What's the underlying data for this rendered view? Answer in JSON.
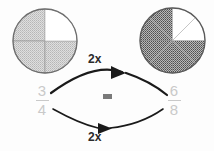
{
  "diagram": {
    "background_color": "#fdfdfd",
    "left_pie": {
      "name": "three-fourths-pie",
      "total_sectors": 4,
      "shaded_sectors": 3,
      "unshaded_sectors": 1,
      "unshaded_position": "upper-right quadrant",
      "fill_color": "#d0d0d0",
      "outline_color": "#6e6e6e",
      "divider_color": "#9a9a9a",
      "pattern": "fine dotted stipple"
    },
    "right_pie": {
      "name": "six-eighths-pie",
      "total_sectors": 8,
      "shaded_sectors": 6,
      "unshaded_sectors": 2,
      "unshaded_position": "upper-right quadrant (two eighths)",
      "fill_color": "#8f8f8f",
      "outline_color": "#5a5a5a",
      "divider_color": "#8a8a8a",
      "pattern": "dense checker stipple"
    },
    "fraction_left": {
      "numerator": "3",
      "denominator": "4",
      "color": "#c9c9c9"
    },
    "fraction_right": {
      "numerator": "6",
      "denominator": "8",
      "color": "#c9c9c9"
    },
    "equals_sign": {
      "label": "=",
      "color": "#7a7a7a"
    },
    "arrow_top": {
      "label": "2x",
      "direction": "left-to-right",
      "curve": "arc bulging upward",
      "color": "#1a1a1a"
    },
    "arrow_bottom": {
      "label": "2x",
      "direction": "left-to-right",
      "curve": "arc bulging downward",
      "color": "#1a1a1a"
    }
  }
}
